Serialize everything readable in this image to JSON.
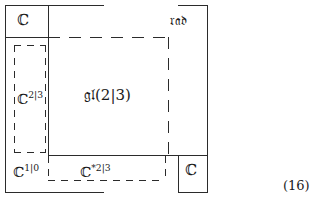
{
  "figure": {
    "equation_number": "(16)",
    "labels": {
      "top_left_box": "ℂ",
      "top_right": "𝔯𝔞𝔡",
      "left_dashed_block": "ℂ",
      "left_dashed_block_sup": "2|3",
      "center_block": "𝔤𝔩(2|3)",
      "bottom_left": "ℂ",
      "bottom_left_sup": "1|0",
      "bottom_center": "ℂ",
      "bottom_center_sup": "*2|3",
      "bottom_right_box": "ℂ"
    }
  },
  "colors": {
    "line": "#2b2b2b",
    "text": "#1a1a1a",
    "background": "#ffffff"
  }
}
